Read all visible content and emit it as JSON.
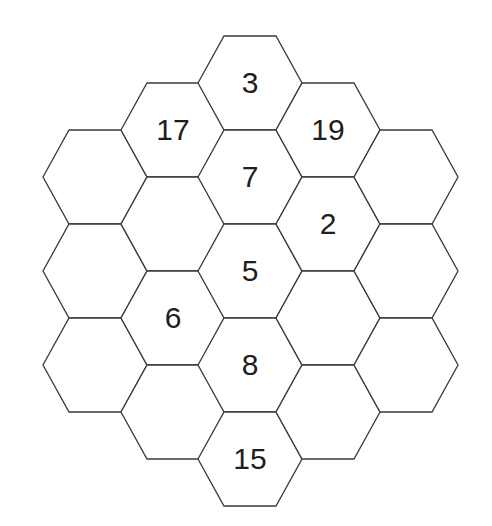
{
  "puzzle": {
    "type": "hexagonal-grid",
    "hex_geometry": {
      "half_width": 52,
      "corner_inset": 26,
      "half_height": 47
    },
    "colors": {
      "background": "#ffffff",
      "stroke": "#3a3a3a",
      "text": "#1e1e1e"
    },
    "cells": [
      {
        "id": "c1r1",
        "column": 1,
        "cx": 95,
        "cy": 177,
        "value": ""
      },
      {
        "id": "c1r2",
        "column": 1,
        "cx": 95,
        "cy": 271,
        "value": ""
      },
      {
        "id": "c1r3",
        "column": 1,
        "cx": 95,
        "cy": 365,
        "value": ""
      },
      {
        "id": "c2r1",
        "column": 2,
        "cx": 173,
        "cy": 130,
        "value": "17"
      },
      {
        "id": "c2r2",
        "column": 2,
        "cx": 173,
        "cy": 224,
        "value": ""
      },
      {
        "id": "c2r3",
        "column": 2,
        "cx": 173,
        "cy": 318,
        "value": "6"
      },
      {
        "id": "c2r4",
        "column": 2,
        "cx": 173,
        "cy": 412,
        "value": ""
      },
      {
        "id": "c3r1",
        "column": 3,
        "cx": 250,
        "cy": 83,
        "value": "3"
      },
      {
        "id": "c3r2",
        "column": 3,
        "cx": 250,
        "cy": 177,
        "value": "7"
      },
      {
        "id": "c3r3",
        "column": 3,
        "cx": 250,
        "cy": 271,
        "value": "5"
      },
      {
        "id": "c3r4",
        "column": 3,
        "cx": 250,
        "cy": 365,
        "value": "8"
      },
      {
        "id": "c3r5",
        "column": 3,
        "cx": 250,
        "cy": 459,
        "value": "15"
      },
      {
        "id": "c4r1",
        "column": 4,
        "cx": 328,
        "cy": 130,
        "value": "19"
      },
      {
        "id": "c4r2",
        "column": 4,
        "cx": 328,
        "cy": 224,
        "value": "2"
      },
      {
        "id": "c4r3",
        "column": 4,
        "cx": 328,
        "cy": 318,
        "value": ""
      },
      {
        "id": "c4r4",
        "column": 4,
        "cx": 328,
        "cy": 412,
        "value": ""
      },
      {
        "id": "c5r1",
        "column": 5,
        "cx": 406,
        "cy": 177,
        "value": ""
      },
      {
        "id": "c5r2",
        "column": 5,
        "cx": 406,
        "cy": 271,
        "value": ""
      },
      {
        "id": "c5r3",
        "column": 5,
        "cx": 406,
        "cy": 365,
        "value": ""
      }
    ]
  }
}
